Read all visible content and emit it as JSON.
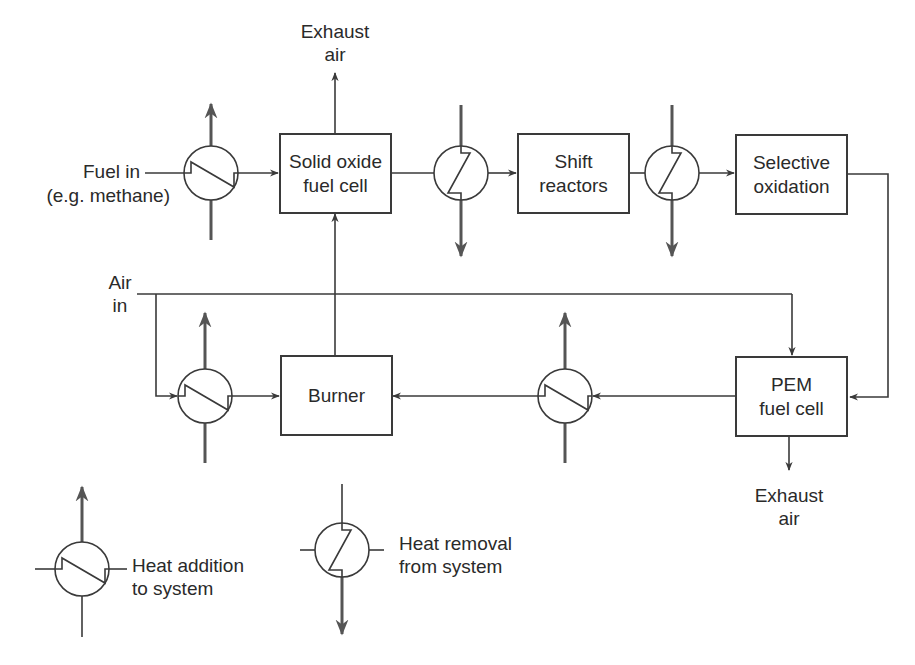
{
  "diagram": {
    "type": "process-flow",
    "colors": {
      "line": "#3a3a3a",
      "heat_arrow": "#555555",
      "background": "#ffffff"
    },
    "blocks": {
      "sofc": {
        "line1": "Solid oxide",
        "line2": "fuel cell"
      },
      "shift": {
        "line1": "Shift",
        "line2": "reactors"
      },
      "selox": {
        "line1": "Selective",
        "line2": "oxidation"
      },
      "burner": {
        "line1": "Burner"
      },
      "pem": {
        "line1": "PEM",
        "line2": "fuel cell"
      }
    },
    "labels": {
      "fuel_in": {
        "line1": "Fuel in",
        "line2": "(e.g. methane)"
      },
      "exhaust_top": {
        "line1": "Exhaust",
        "line2": "air"
      },
      "air_in": {
        "line1": "Air",
        "line2": "in"
      },
      "exhaust_bottom": {
        "line1": "Exhaust",
        "line2": "air"
      }
    },
    "heat_exchangers": [
      {
        "id": "hx1",
        "kind": "heat-addition",
        "location": "fuel preheat"
      },
      {
        "id": "hx2",
        "kind": "heat-removal",
        "location": "after SOFC"
      },
      {
        "id": "hx3",
        "kind": "heat-removal",
        "location": "after shift reactors"
      },
      {
        "id": "hx4",
        "kind": "heat-addition",
        "location": "air preheat to burner"
      },
      {
        "id": "hx5",
        "kind": "heat-addition",
        "location": "PEM exhaust to burner"
      }
    ],
    "legend": {
      "addition": {
        "line1": "Heat addition",
        "line2": "to system"
      },
      "removal": {
        "line1": "Heat removal",
        "line2": "from system"
      }
    }
  }
}
